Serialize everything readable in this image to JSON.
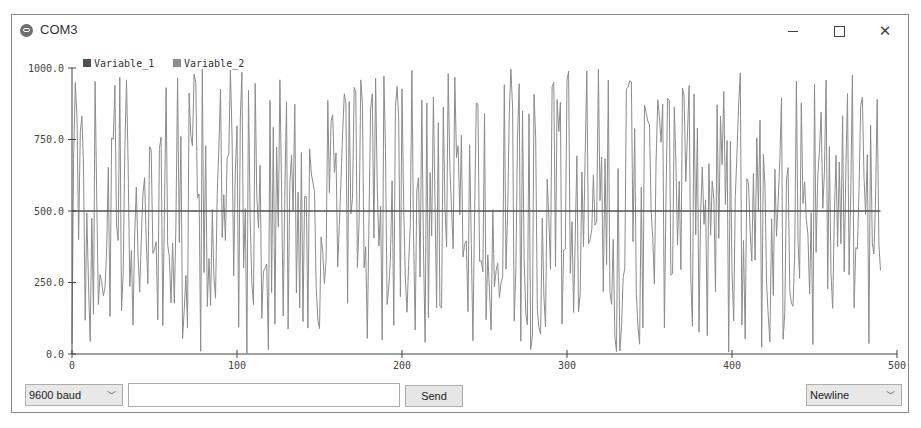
{
  "window": {
    "title": "COM3",
    "controls": {
      "minimize": "minimize",
      "maximize": "maximize",
      "close": "close"
    }
  },
  "toolbar": {
    "baud_value": "9600 baud",
    "message_value": "",
    "send_label": "Send",
    "line_ending_value": "Newline"
  },
  "colors": {
    "series_1": "#505050",
    "series_2": "#8c8c8c",
    "axis": "#444444"
  },
  "chart_data": {
    "type": "line",
    "title": "",
    "xlabel": "",
    "ylabel": "",
    "xlim": [
      0,
      500
    ],
    "ylim": [
      0,
      1000
    ],
    "x_ticks": [
      "0",
      "100",
      "200",
      "300",
      "400",
      "500"
    ],
    "y_ticks": [
      "0.0",
      "250.0",
      "500.0",
      "750.0",
      "1000.0"
    ],
    "legend_position": "top-left",
    "grid": false,
    "series": [
      {
        "name": "Variable_1",
        "description": "constant 500 across samples 0-490",
        "values_constant": 500,
        "x_range": [
          0,
          490
        ]
      },
      {
        "name": "Variable_2",
        "description": "random values between 0 and 1000, one per sample, samples 0-490",
        "seed": 1337,
        "count": 491,
        "min": 0,
        "max": 1000
      }
    ]
  }
}
